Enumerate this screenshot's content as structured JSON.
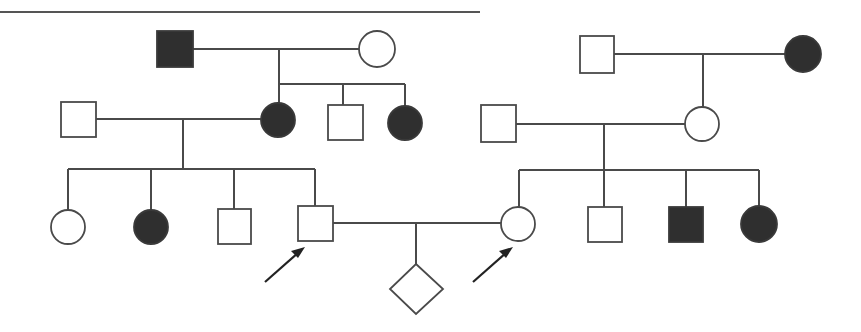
{
  "diagram": {
    "type": "pedigree",
    "colors": {
      "line": "#4a4a4a",
      "affected_fill": "#2f2f2f",
      "unaffected_fill": "#ffffff",
      "arrow": "#222222"
    },
    "legend": {
      "square": "male",
      "circle": "female",
      "diamond": "sex unspecified",
      "filled": "affected",
      "open": "unaffected",
      "arrow": "proband"
    },
    "families": {
      "left": {
        "generation_1": [
          {
            "id": "L1-1",
            "sex": "male",
            "affected": true
          },
          {
            "id": "L1-2",
            "sex": "female",
            "affected": false
          }
        ],
        "generation_2": [
          {
            "id": "L2-spouse",
            "sex": "male",
            "affected": false
          },
          {
            "id": "L2-1",
            "sex": "female",
            "affected": true
          },
          {
            "id": "L2-2",
            "sex": "male",
            "affected": false
          },
          {
            "id": "L2-3",
            "sex": "female",
            "affected": true
          }
        ],
        "generation_3": [
          {
            "id": "L3-1",
            "sex": "female",
            "affected": false
          },
          {
            "id": "L3-2",
            "sex": "female",
            "affected": true
          },
          {
            "id": "L3-3",
            "sex": "male",
            "affected": false
          },
          {
            "id": "L3-4",
            "sex": "male",
            "affected": false,
            "proband": true
          }
        ]
      },
      "right": {
        "generation_1": [
          {
            "id": "R1-1",
            "sex": "male",
            "affected": false
          },
          {
            "id": "R1-2",
            "sex": "female",
            "affected": true
          }
        ],
        "generation_2": [
          {
            "id": "R2-spouse",
            "sex": "male",
            "affected": false
          },
          {
            "id": "R2-1",
            "sex": "female",
            "affected": false
          }
        ],
        "generation_3": [
          {
            "id": "R3-1",
            "sex": "female",
            "affected": false,
            "proband": true
          },
          {
            "id": "R3-2",
            "sex": "male",
            "affected": false
          },
          {
            "id": "R3-3",
            "sex": "male",
            "affected": true
          },
          {
            "id": "R3-4",
            "sex": "female",
            "affected": true
          }
        ]
      },
      "offspring": [
        {
          "id": "C-1",
          "sex": "unknown",
          "affected": false
        }
      ]
    }
  }
}
